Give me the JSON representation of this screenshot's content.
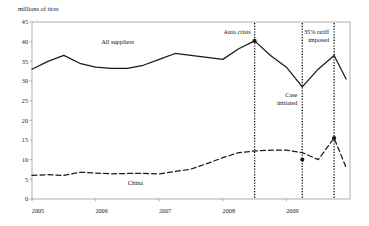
{
  "chart_data": {
    "type": "line",
    "title": "",
    "ylabel": "millions of tires",
    "xlabel": "",
    "ylim": [
      0,
      45
    ],
    "yticks": [
      0,
      5,
      10,
      15,
      20,
      25,
      30,
      35,
      40,
      45
    ],
    "xticks": [
      "2005",
      "2006",
      "2007",
      "2008",
      "2009"
    ],
    "grid": false,
    "legend_position": "inline",
    "x": [
      "2005Q1",
      "2005Q2",
      "2005Q3",
      "2005Q4",
      "2006Q1",
      "2006Q2",
      "2006Q3",
      "2006Q4",
      "2007Q1",
      "2007Q2",
      "2007Q3",
      "2007Q4",
      "2008Q1",
      "2008Q2",
      "2008Q3",
      "2008Q4",
      "2009Q1",
      "2009Q2",
      "2009Q3",
      "2009Q4"
    ],
    "series": [
      {
        "name": "All suppliers",
        "style": "solid",
        "values": [
          33.0,
          35.0,
          36.5,
          34.5,
          33.5,
          33.2,
          33.2,
          34.0,
          35.5,
          37.0,
          36.5,
          36.0,
          35.5,
          38.2,
          40.2,
          36.5,
          33.5,
          28.5,
          33.0,
          36.5
        ]
      },
      {
        "name": "China",
        "style": "dashed",
        "values": [
          6.0,
          6.2,
          6.0,
          6.8,
          6.6,
          6.4,
          6.5,
          6.5,
          6.4,
          7.0,
          7.6,
          9.0,
          10.5,
          11.8,
          12.2,
          12.4,
          12.4,
          11.8,
          10.0,
          15.5
        ]
      }
    ],
    "series_label_positions": [
      {
        "name": "All suppliers",
        "x_index": 4,
        "y_value": 39.5
      },
      {
        "name": "China",
        "y_value": 3.6,
        "x_index": 6
      }
    ],
    "tail_points": {
      "all_suppliers_end": 30.5,
      "china_end": 8.0
    },
    "events": [
      {
        "label": "Auto crisis",
        "x_index": 14,
        "label_lines": [
          "Auto crisis"
        ],
        "marker_value": 40.2,
        "marker_series": "All suppliers"
      },
      {
        "label": "Case initiated",
        "x_index": 17,
        "label_lines": [
          "Case",
          "initiated"
        ],
        "marker_value": 10.0,
        "marker_series": "China"
      },
      {
        "label": "35% tariff imposed",
        "x_index": 19,
        "label_lines": [
          "35% tariff",
          "imposed"
        ],
        "marker_value": 15.5,
        "marker_series": "China"
      }
    ],
    "colors": {
      "line": "#1a1a1a",
      "axis": "#8a8a8a",
      "event_line": "#000000",
      "background": "#ffffff"
    }
  }
}
